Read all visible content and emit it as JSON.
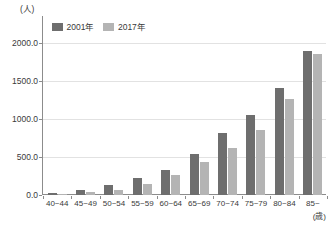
{
  "chart_data": {
    "type": "bar",
    "title": "",
    "subtitle": "",
    "xlabel": "(歳)",
    "ylabel": "(人)",
    "categories": [
      "40~44",
      "45~49",
      "50~54",
      "55~59",
      "60~64",
      "65~69",
      "70~74",
      "75~79",
      "80~84",
      "85~"
    ],
    "series": [
      {
        "name": "2001年",
        "color": "#6e6e6e",
        "values": [
          25,
          68,
          130,
          225,
          330,
          545,
          810,
          1055,
          1410,
          1885
        ]
      },
      {
        "name": "2017年",
        "color": "#b4b4b4",
        "values": [
          12,
          35,
          72,
          150,
          260,
          430,
          615,
          860,
          1265,
          1850
        ]
      }
    ],
    "ylim": [
      0,
      2350
    ],
    "yticks": [
      0,
      500,
      1000,
      1500,
      2000
    ],
    "ytick_labels": [
      "0.0",
      "500.0",
      "1000.0",
      "1500.0",
      "2000.0"
    ],
    "grid": true,
    "legend_position": "top-left",
    "axis_color": "#8c8c8c",
    "grid_color": "#e2e2e2",
    "background": "#ffffff"
  }
}
